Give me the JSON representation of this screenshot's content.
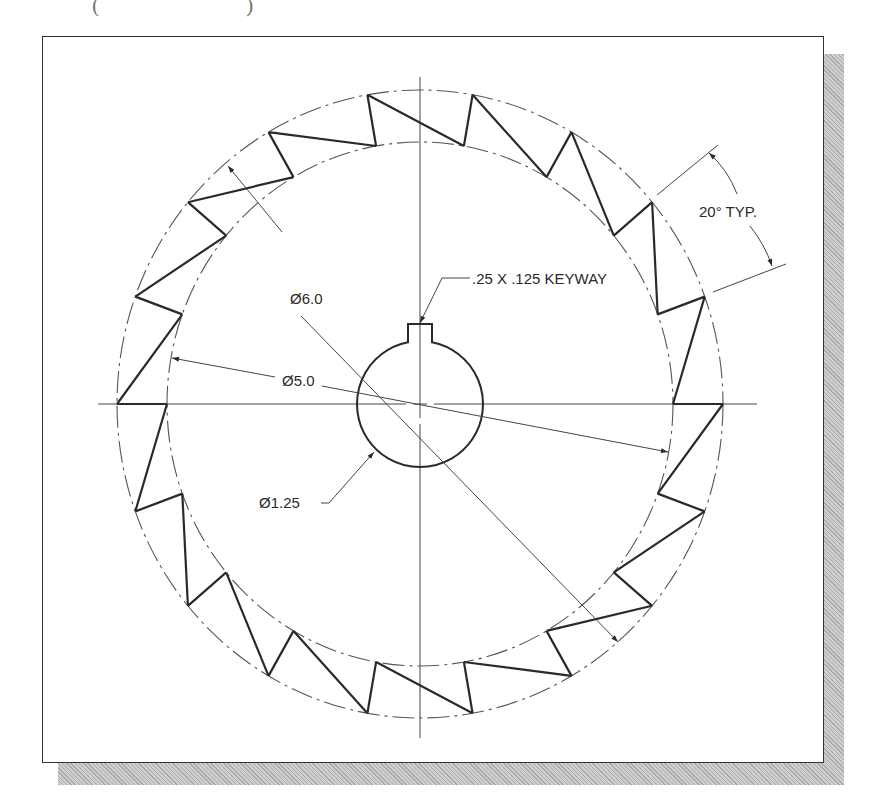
{
  "figure": {
    "type": "engineering-drawing",
    "top_fragments": [
      "(",
      ")"
    ]
  },
  "geometry": {
    "center": {
      "x": 420,
      "y": 404
    },
    "outer_circle": {
      "rx": 303,
      "ry": 314,
      "style": "phantom-dashed"
    },
    "inner_circle": {
      "rx": 253,
      "ry": 262,
      "style": "phantom-dashed"
    },
    "tooth_count": 18,
    "tooth_pitch_deg": 20,
    "shaft_hole": {
      "r": 63
    },
    "keyway": {
      "half_width": 12,
      "top_y": 324
    },
    "centerlines": {
      "horizontal": {
        "x1": 98,
        "x2": 757
      },
      "vertical": {
        "y1": 77,
        "y2": 738
      }
    }
  },
  "dimensions": {
    "outer_diameter": {
      "label": "Ø6.0",
      "x": 290,
      "y": 304
    },
    "root_diameter": {
      "label": "Ø5.0",
      "x": 282,
      "y": 386
    },
    "bore_diameter": {
      "label": "Ø1.25",
      "x": 259,
      "y": 508
    },
    "keyway": {
      "label": ".25 X .125 KEYWAY",
      "x": 472,
      "y": 284
    },
    "tooth_angle": {
      "label": "20° TYP.",
      "x": 699,
      "y": 217
    }
  },
  "colors": {
    "line": "#2a2a2a",
    "thin": "#555555",
    "frame": "#333333",
    "shadow": "#bdbdbd"
  }
}
